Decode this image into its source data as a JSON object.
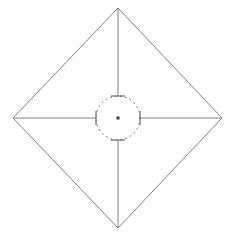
{
  "canvas": {
    "width": 235,
    "height": 245,
    "background_color": "#ffffff",
    "name": "diamond-radial-diagram"
  },
  "style": {
    "stroke_color": "#808080",
    "stroke_color_dark": "#6e6e6e",
    "center_dot_color": "#333333",
    "outline_stroke_width": 1,
    "radial_stroke_width": 1,
    "circle_stroke_width": 1,
    "tick_stroke_width": 1.2,
    "dash_pattern": "2,3"
  },
  "geometry": {
    "center": {
      "x": 118,
      "y": 118
    },
    "circle_radius": 22,
    "tick_half_length": 5
  },
  "diamond": {
    "label": "diamond-outline",
    "vertices": [
      {
        "name": "top",
        "x": 118,
        "y": 8
      },
      {
        "name": "right",
        "x": 222,
        "y": 118
      },
      {
        "name": "bottom",
        "x": 118,
        "y": 228
      },
      {
        "name": "left",
        "x": 13,
        "y": 118
      }
    ],
    "points_attr": "118,8 222,118 118,228 13,118"
  },
  "radials": [
    {
      "name": "radial-up",
      "direction": "up",
      "x1": 118,
      "y1": 96,
      "x2": 118,
      "y2": 8,
      "tick": {
        "x1": 111,
        "y1": 96,
        "x2": 125,
        "y2": 96
      }
    },
    {
      "name": "radial-right",
      "direction": "right",
      "x1": 140,
      "y1": 118,
      "x2": 222,
      "y2": 118,
      "tick": {
        "x1": 140,
        "y1": 111,
        "x2": 140,
        "y2": 125
      }
    },
    {
      "name": "radial-down",
      "direction": "down",
      "x1": 118,
      "y1": 140,
      "x2": 118,
      "y2": 228,
      "tick": {
        "x1": 111,
        "y1": 140,
        "x2": 125,
        "y2": 140
      }
    },
    {
      "name": "radial-left",
      "direction": "left",
      "x1": 96,
      "y1": 118,
      "x2": 13,
      "y2": 118,
      "tick": {
        "x1": 96,
        "y1": 111,
        "x2": 96,
        "y2": 125
      }
    }
  ],
  "center_marker": {
    "name": "center-dot",
    "x": 118,
    "y": 118,
    "size": 3
  }
}
